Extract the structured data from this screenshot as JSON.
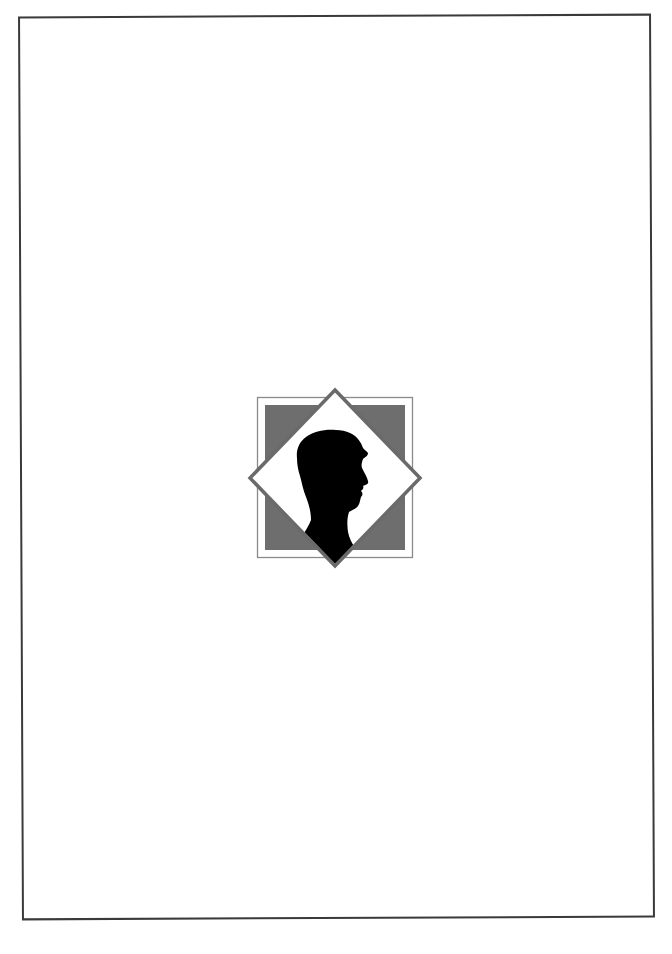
{
  "page": {
    "type": "title-page-blank",
    "frame_color": "#3a3a3a",
    "background_color": "#ffffff"
  },
  "emblem": {
    "description": "Silhouette of a boy's head in profile inside a diamond over a gray square",
    "outer_square": {
      "x": 257,
      "y": 397,
      "width": 156,
      "height": 161,
      "stroke": "#8a8a8a"
    },
    "gray_square": {
      "x": 265,
      "y": 405,
      "width": 140,
      "height": 145,
      "fill": "#6e6e6e"
    },
    "diamond": {
      "cx": 335,
      "cy": 478,
      "half_width": 86,
      "half_height": 89,
      "fill": "#ffffff",
      "stroke": "#6a6a6a",
      "stroke_width": 3.5
    },
    "silhouette": {
      "fill": "#000000",
      "icon": "person-profile-silhouette"
    }
  }
}
